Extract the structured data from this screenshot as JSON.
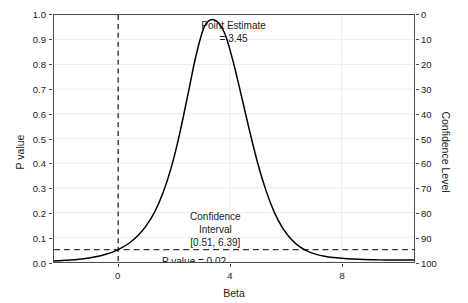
{
  "chart_data": {
    "type": "line",
    "title": "",
    "xlabel": "Beta",
    "ylabel": "P value",
    "y2label": "Confidence Level",
    "xlim": [
      -2.3,
      10.6
    ],
    "ylim": [
      0.0,
      1.0
    ],
    "y2lim": [
      100,
      0
    ],
    "grid": true,
    "legend": null,
    "xticks": [
      0,
      4,
      8
    ],
    "xticklabels": [
      "0",
      "4",
      "8"
    ],
    "yticks": [
      0.0,
      0.1,
      0.2,
      0.3,
      0.4,
      0.5,
      0.6,
      0.7,
      0.8,
      0.9,
      1.0
    ],
    "yticklabels": [
      "0.0",
      "0.1",
      "0.2",
      "0.3",
      "0.4",
      "0.5",
      "0.6",
      "0.7",
      "0.8",
      "0.9",
      "1.0"
    ],
    "y2ticks": [
      0,
      10,
      20,
      30,
      40,
      50,
      60,
      70,
      80,
      90,
      100
    ],
    "y2ticklabels": [
      "0",
      "10",
      "20",
      "30",
      "40",
      "50",
      "60",
      "70",
      "80",
      "90",
      "100"
    ],
    "series": [
      {
        "name": "P value function",
        "color": "#000000",
        "x": [
          -2.3,
          -2.0,
          -1.7,
          -1.4,
          -1.1,
          -0.8,
          -0.5,
          -0.2,
          0.1,
          0.4,
          0.7,
          1.0,
          1.3,
          1.6,
          1.9,
          2.2,
          2.5,
          2.8,
          3.1,
          3.45,
          3.8,
          4.1,
          4.4,
          4.7,
          5.0,
          5.3,
          5.6,
          5.9,
          6.2,
          6.5,
          6.8,
          7.1,
          7.4,
          7.7,
          8.0,
          8.4,
          8.8,
          9.2,
          9.6,
          10.0,
          10.6
        ],
        "y": [
          0.004,
          0.006,
          0.008,
          0.011,
          0.015,
          0.021,
          0.029,
          0.04,
          0.056,
          0.077,
          0.106,
          0.146,
          0.201,
          0.278,
          0.382,
          0.518,
          0.679,
          0.841,
          0.955,
          0.98,
          0.93,
          0.82,
          0.68,
          0.535,
          0.4,
          0.288,
          0.2,
          0.136,
          0.092,
          0.062,
          0.043,
          0.031,
          0.023,
          0.018,
          0.015,
          0.012,
          0.01,
          0.009,
          0.008,
          0.008,
          0.008
        ]
      }
    ],
    "reference_lines": [
      {
        "name": "null-value-line",
        "orientation": "vertical",
        "x": 0,
        "style": "dashed",
        "color": "#333333"
      },
      {
        "name": "alpha-line",
        "orientation": "horizontal",
        "y": 0.05,
        "style": "dashed",
        "color": "#333333"
      }
    ],
    "annotations": [
      {
        "name": "point-estimate",
        "lines": [
          "Point Estimate",
          "= 3.45"
        ],
        "x": 4.1,
        "y": 0.985
      },
      {
        "name": "confidence-interval",
        "lines": [
          "Confidence",
          "Interval",
          "[0.51, 6.39]"
        ],
        "x": 3.45,
        "y": 0.215
      },
      {
        "name": "p-value",
        "lines": [
          "P value  = 0.02"
        ],
        "x": 1.55,
        "y": 0.035
      }
    ],
    "point_estimate": 3.45,
    "confidence_interval": [
      0.51,
      6.39
    ],
    "p_value": 0.02,
    "alpha": 0.05
  },
  "axes": {
    "y_left": {
      "title": "P value",
      "ticks": [
        "1.0",
        "0.9",
        "0.8",
        "0.7",
        "0.6",
        "0.5",
        "0.4",
        "0.3",
        "0.2",
        "0.1",
        "0.0"
      ]
    },
    "y_right": {
      "title": "Confidence Level",
      "ticks": [
        "0",
        "10",
        "20",
        "30",
        "40",
        "50",
        "60",
        "70",
        "80",
        "90",
        "100"
      ]
    },
    "x": {
      "title": "Beta",
      "ticks": [
        "0",
        "4",
        "8"
      ]
    }
  },
  "annotations": {
    "point_estimate_line1": "Point Estimate",
    "point_estimate_line2": "= 3.45",
    "confidence_line1": "Confidence",
    "confidence_line2": "Interval",
    "confidence_line3": "[0.51, 6.39]",
    "p_value_text": "P value  = 0.02"
  },
  "colors": {
    "curve": "#000000",
    "reference_line": "#333333",
    "grid": "#ececec",
    "panel_border": "#4d4d4d",
    "background": "#ffffff",
    "text": "#1a1a1a"
  }
}
